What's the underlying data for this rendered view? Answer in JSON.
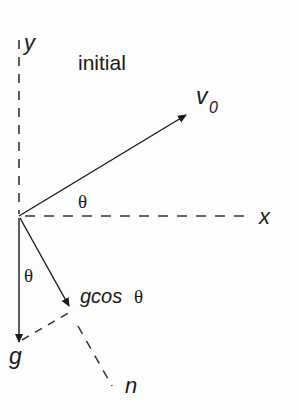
{
  "diagram": {
    "title": "initial",
    "axes": {
      "y_label": "y",
      "x_label": "x",
      "n_label": "n"
    },
    "vectors": {
      "v0": {
        "label_main": "v",
        "label_sub": "0"
      },
      "g": {
        "label": "g"
      },
      "g_component": {
        "label_prefix": "gcos",
        "label_theta": "θ"
      }
    },
    "angles": {
      "launch_angle": "θ",
      "gravity_angle": "θ"
    },
    "colors": {
      "ink": "#1a1a1a",
      "background": "#fdfdfd"
    }
  }
}
